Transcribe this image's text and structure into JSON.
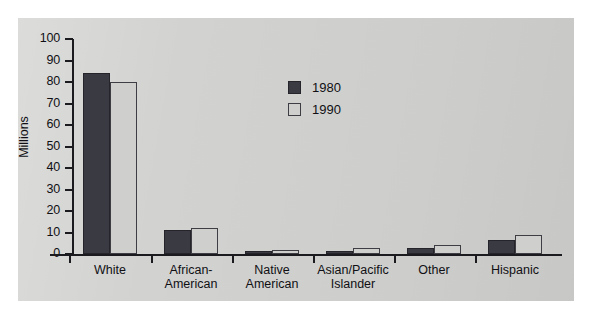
{
  "chart_data": {
    "type": "bar",
    "title": "",
    "subtitle": "",
    "xlabel": "",
    "ylabel": "Millions",
    "ylim": [
      0,
      100
    ],
    "yticks": [
      0,
      10,
      20,
      30,
      40,
      50,
      60,
      70,
      80,
      90,
      100
    ],
    "ytick_labels": [
      "0",
      "10",
      "20",
      "30",
      "40",
      "50",
      "60",
      "70",
      "80",
      "90",
      "100"
    ],
    "grid": false,
    "legend_position": "upper-center-right",
    "categories": [
      "White",
      "African-\nAmerican",
      "Native\nAmerican",
      "Asian/Pacific\nIslander",
      "Other",
      "Hispanic"
    ],
    "series": [
      {
        "name": "1980",
        "color": "#3a3a42",
        "values": [
          84,
          11,
          1.4,
          1.5,
          3,
          6.5
        ]
      },
      {
        "name": "1990",
        "color": "#cfcfcd",
        "values": [
          80,
          12,
          2,
          3,
          4,
          9
        ]
      }
    ]
  },
  "legend": {
    "items": [
      {
        "label": "1980",
        "swatch": "dark-swatch"
      },
      {
        "label": "1990",
        "swatch": "light-swatch"
      }
    ]
  },
  "axis": {
    "y_title": "Millions"
  },
  "colors": {
    "panel_background": "#d2d2d0",
    "axis": "#1b1b1f",
    "text": "#101014",
    "series_1980": "#3a3a42",
    "series_1990": "#cfcfcd"
  }
}
